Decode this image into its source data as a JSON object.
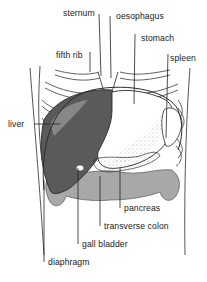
{
  "diagram": {
    "colors": {
      "line": "#2a2a2a",
      "liver": "#5a5a5a",
      "liver_light": "#9a9a9a",
      "colon": "#a8a8a8",
      "stomach": "#ffffff",
      "stipple": "#555555",
      "background": "#ffffff"
    },
    "labels": {
      "sternum": "sternum",
      "oesophagus": "oesophagus",
      "stomach": "stomach",
      "fifth_rib": "fifth rib",
      "spleen": "spleen",
      "liver": "liver",
      "pancreas": "pancreas",
      "transverse_colon": "transverse colon",
      "gall_bladder": "gall bladder",
      "diaphragm": "diaphragm"
    }
  }
}
